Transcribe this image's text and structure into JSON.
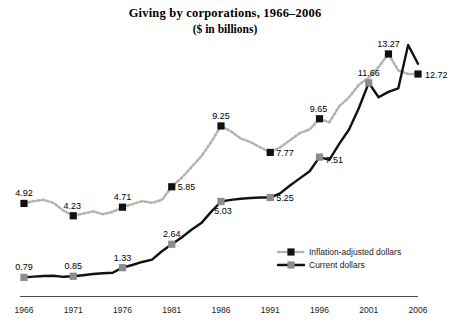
{
  "chart_data": {
    "type": "line",
    "title": "Giving by corporations, 1966–2006",
    "subtitle": "($ in billions)",
    "xlabel": "",
    "ylabel": "",
    "grid": false,
    "legend_position": "inside-bottom-right",
    "xlim": [
      1966,
      2006
    ],
    "ylim": [
      0,
      14.5
    ],
    "tick_labels": [
      "1966",
      "1971",
      "1976",
      "1981",
      "1986",
      "1991",
      "1996",
      "2001",
      "2006"
    ],
    "x": [
      1966,
      1967,
      1968,
      1969,
      1970,
      1971,
      1972,
      1973,
      1974,
      1975,
      1976,
      1977,
      1978,
      1979,
      1980,
      1981,
      1982,
      1983,
      1984,
      1985,
      1986,
      1987,
      1988,
      1989,
      1990,
      1991,
      1992,
      1993,
      1994,
      1995,
      1996,
      1997,
      1998,
      1999,
      2000,
      2001,
      2002,
      2003,
      2004,
      2005,
      2006
    ],
    "series": [
      {
        "name": "Inflation-adjusted dollars",
        "style": "dotted",
        "color": "#b3b3b3",
        "marker_color": "#111111",
        "values": [
          4.92,
          5.05,
          5.12,
          4.95,
          4.52,
          4.23,
          4.35,
          4.48,
          4.32,
          4.45,
          4.71,
          4.88,
          5.05,
          4.95,
          5.12,
          5.85,
          6.35,
          6.95,
          7.55,
          8.35,
          9.25,
          8.95,
          8.55,
          8.35,
          8.05,
          7.77,
          8.05,
          8.45,
          8.85,
          9.05,
          9.65,
          9.45,
          10.35,
          10.85,
          11.55,
          11.95,
          12.55,
          13.27,
          12.35,
          12.15,
          12.15
        ],
        "labeled_points": [
          {
            "x": 1966,
            "value": "4.92"
          },
          {
            "x": 1971,
            "value": "4.23"
          },
          {
            "x": 1976,
            "value": "4.71"
          },
          {
            "x": 1981,
            "value": "5.85"
          },
          {
            "x": 1986,
            "value": "9.25"
          },
          {
            "x": 1991,
            "value": "7.77"
          },
          {
            "x": 1996,
            "value": "9.65"
          },
          {
            "x": 2003,
            "value": "13.27"
          },
          {
            "x": 2006,
            "value": "12.72"
          }
        ]
      },
      {
        "name": "Current dollars",
        "style": "solid",
        "color": "#111111",
        "marker_color": "#8c8c8c",
        "values": [
          0.79,
          0.83,
          0.87,
          0.88,
          0.82,
          0.85,
          0.91,
          0.98,
          1.02,
          1.05,
          1.33,
          1.48,
          1.65,
          1.78,
          2.25,
          2.64,
          3.02,
          3.45,
          3.82,
          4.45,
          5.03,
          5.12,
          5.18,
          5.22,
          5.25,
          5.25,
          5.48,
          5.92,
          6.32,
          6.72,
          7.51,
          7.35,
          8.25,
          9.05,
          10.25,
          11.66,
          10.85,
          11.15,
          11.35,
          13.77,
          12.72
        ],
        "labeled_points": [
          {
            "x": 1966,
            "value": "0.79"
          },
          {
            "x": 1971,
            "value": "0.85"
          },
          {
            "x": 1976,
            "value": "1.33"
          },
          {
            "x": 1981,
            "value": "2.64"
          },
          {
            "x": 1986,
            "value": "5.03"
          },
          {
            "x": 1991,
            "value": "5.25"
          },
          {
            "x": 1996,
            "value": "7.51"
          },
          {
            "x": 2001,
            "value": "11.66"
          }
        ]
      }
    ],
    "legend": [
      {
        "label": "Inflation-adjusted dollars",
        "style": "dotted",
        "color": "#b3b3b3",
        "marker_color": "#111111"
      },
      {
        "label": "Current dollars",
        "style": "solid",
        "color": "#111111",
        "marker_color": "#8c8c8c"
      }
    ]
  }
}
